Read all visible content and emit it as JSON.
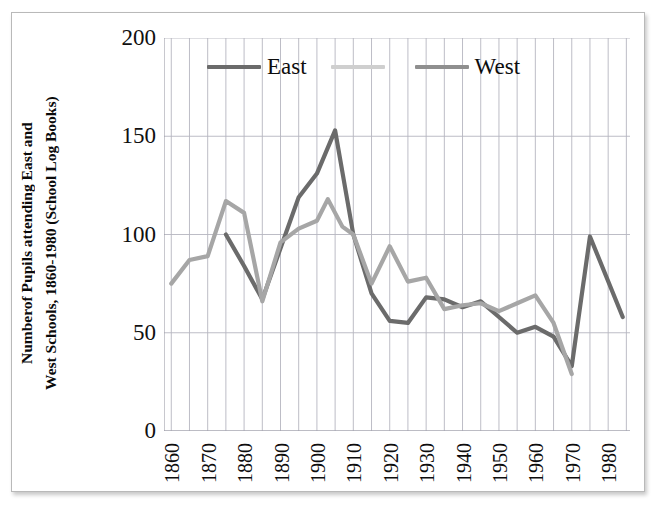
{
  "chart_data": {
    "type": "line",
    "title": "",
    "xlabel": "",
    "ylabel": "Numberof Pupils attending East and West Schools, 1860-1980 (School Log Books)",
    "ylabel_lines": [
      "Numberof Pupils attending East and",
      "West Schools,"
    ],
    "ylabel_line2_full": "1860-1980 (School Log Books)",
    "xlim": [
      1858,
      1986
    ],
    "ylim": [
      0,
      200
    ],
    "y_ticks": [
      200,
      150,
      100,
      50,
      0
    ],
    "x_ticks": [
      1860,
      1870,
      1880,
      1890,
      1900,
      1910,
      1920,
      1930,
      1940,
      1950,
      1960,
      1970,
      1980
    ],
    "grid": "vertical-every-5-years, horizontal-every-50-units",
    "legend_position": "top-inside",
    "colors": {
      "east": "#6b6b6b",
      "west": "#a6a6a6",
      "blank": "#cfcfcf",
      "grid": "#b5b5c0",
      "axis": "#9a9aa6",
      "frame": "#b9b9b9",
      "text": "#0d0d0d"
    },
    "series": [
      {
        "name": "East",
        "color": "#6b6b6b",
        "x": [
          1875,
          1880,
          1885,
          1890,
          1895,
          1900,
          1905,
          1910,
          1915,
          1920,
          1925,
          1930,
          1935,
          1940,
          1945,
          1950,
          1955,
          1960,
          1965,
          1970,
          1975,
          1984
        ],
        "y": [
          100,
          84,
          67,
          93,
          119,
          131,
          153,
          100,
          70,
          56,
          55,
          68,
          67,
          63,
          66,
          58,
          50,
          53,
          48,
          33,
          99,
          58
        ]
      },
      {
        "name": "",
        "color": "#cfcfcf",
        "x": [],
        "y": []
      },
      {
        "name": "West",
        "color": "#a6a6a6",
        "x": [
          1860,
          1865,
          1870,
          1875,
          1880,
          1885,
          1890,
          1895,
          1900,
          1903,
          1907,
          1910,
          1915,
          1920,
          1925,
          1930,
          1935,
          1940,
          1945,
          1950,
          1955,
          1960,
          1965,
          1970
        ],
        "y": [
          75,
          87,
          89,
          117,
          111,
          66,
          96,
          103,
          107,
          118,
          104,
          100,
          75,
          94,
          76,
          78,
          62,
          64,
          65,
          61,
          65,
          69,
          55,
          29
        ]
      }
    ]
  },
  "legend": {
    "entries": [
      {
        "label": "East",
        "color": "#6b6b6b"
      },
      {
        "label": "",
        "color": "#cfcfcf"
      },
      {
        "label": "West",
        "color": "#8f8f8f"
      }
    ]
  },
  "axes": {
    "y_ticks": [
      "200",
      "150",
      "100",
      "50",
      "0"
    ],
    "x_ticks": [
      "1860",
      "1870",
      "1880",
      "1890",
      "1900",
      "1910",
      "1920",
      "1930",
      "1940",
      "1950",
      "1960",
      "1970",
      "1980"
    ],
    "y_title_line1": "Numberof Pupils attending East and",
    "y_title_line2": "West Schools,",
    "y_title_line3": "1860-1980 (School Log Books)"
  }
}
